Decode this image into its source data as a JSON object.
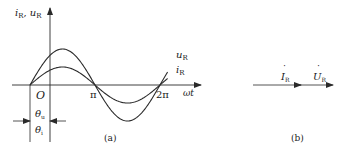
{
  "figure_a": {
    "caption": "(a)",
    "y_axis_label": {
      "main1": "i",
      "sub1": "R",
      "sep": ", ",
      "main2": "u",
      "sub2": "R"
    },
    "x_axis_label": "ωt",
    "origin_label": "O",
    "ticks": [
      {
        "label": "π",
        "x": 95
      },
      {
        "label": "2π",
        "x": 158
      }
    ],
    "curves": [
      {
        "name": "u",
        "label_main": "u",
        "label_sub": "R",
        "amplitude_px": 36
      },
      {
        "name": "i",
        "label_main": "i",
        "label_sub": "R",
        "amplitude_px": 18
      }
    ],
    "phase_labels": {
      "theta_u": {
        "main": "θ",
        "sub": "u"
      },
      "theta_i": {
        "main": "θ",
        "sub": "i"
      }
    },
    "line_color": "#2a2a2a"
  },
  "figure_b": {
    "caption": "(b)",
    "phasors": [
      {
        "label_main": "I",
        "label_sub": "R",
        "dot": "˙"
      },
      {
        "label_main": "U",
        "label_sub": "R",
        "dot": "˙"
      }
    ]
  }
}
